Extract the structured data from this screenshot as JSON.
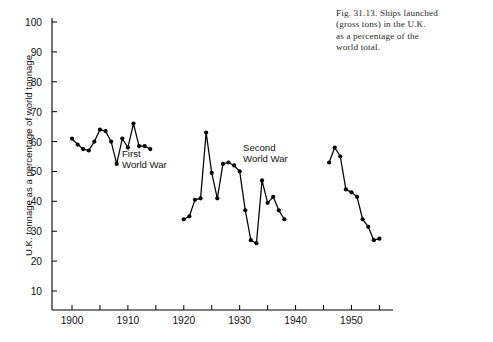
{
  "caption": {
    "figure_number": "Fig. 31.13.",
    "text": "Ships launched (gross tons) in the U.K. as a percentage of the world total.",
    "line1": "Fig. 31.13. Ships launched",
    "line2": "(gross tons) in the U.K.",
    "line3": "as a percentage of the",
    "line4": "world total."
  },
  "annotations": {
    "first_world_war": "First\nWorld War",
    "second_world_war": "Second\nWorld War"
  },
  "chart_data": {
    "type": "line",
    "title": "",
    "xlabel": "",
    "ylabel": "U.K. tonnage as a percentage of world tonnage",
    "xlim": [
      1900,
      1956
    ],
    "ylim": [
      0,
      100
    ],
    "grid": false,
    "legend": "none",
    "yticks": [
      10,
      20,
      30,
      40,
      50,
      60,
      70,
      80,
      90,
      100
    ],
    "ytick_labels": [
      "10",
      "20",
      "30",
      "40",
      "50",
      "60",
      "70",
      "80",
      "90",
      "100"
    ],
    "xticks": [
      1900,
      1905,
      1910,
      1915,
      1920,
      1925,
      1930,
      1935,
      1940,
      1945,
      1950,
      1955
    ],
    "xtick_labels": [
      {
        "value": 1900,
        "label": "1900"
      },
      {
        "value": 1905,
        "label": ""
      },
      {
        "value": 1910,
        "label": "1910"
      },
      {
        "value": 1915,
        "label": ""
      },
      {
        "value": 1920,
        "label": "1920"
      },
      {
        "value": 1925,
        "label": ""
      },
      {
        "value": 1930,
        "label": "1930"
      },
      {
        "value": 1935,
        "label": ""
      },
      {
        "value": 1940,
        "label": "1940"
      },
      {
        "value": 1945,
        "label": ""
      },
      {
        "value": 1950,
        "label": "1950"
      },
      {
        "value": 1955,
        "label": ""
      }
    ],
    "marker": "filled-circle",
    "line_color": "#000000",
    "series": [
      {
        "name": "Pre-First World War",
        "x": [
          1900,
          1901,
          1902,
          1903,
          1904,
          1905,
          1906,
          1907,
          1908,
          1909,
          1910,
          1911,
          1912,
          1913,
          1914
        ],
        "values": [
          61,
          59,
          57.5,
          57,
          60,
          64,
          63.5,
          60,
          52.5,
          61,
          58,
          66,
          58.5,
          58.5,
          57.5
        ]
      },
      {
        "name": "Interwar",
        "x": [
          1920,
          1921,
          1922,
          1923,
          1924,
          1925,
          1926,
          1927,
          1928,
          1929,
          1930,
          1931,
          1932,
          1933,
          1934,
          1935,
          1936,
          1937,
          1938
        ],
        "values": [
          34,
          35,
          40.5,
          41,
          63,
          49.5,
          41,
          52.5,
          53,
          52,
          50,
          37,
          27,
          26,
          47,
          39.5,
          41.5,
          37,
          34
        ]
      },
      {
        "name": "Post-Second World War",
        "x": [
          1946,
          1947,
          1948,
          1949,
          1950,
          1951,
          1952,
          1953,
          1954,
          1955
        ],
        "values": [
          53,
          58,
          55,
          44,
          43,
          41.5,
          34,
          31.5,
          27,
          27.5
        ]
      }
    ]
  }
}
